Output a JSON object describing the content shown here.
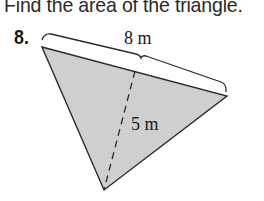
{
  "instruction": "Find the area of the triangle.",
  "problem": {
    "number": "8.",
    "figure": {
      "shape": "triangle",
      "fill_color": "#cfcfcf",
      "stroke_color": "#2b2b2b",
      "base_label": "8 m",
      "height_label": "5 m",
      "height_style": "dashed"
    }
  }
}
